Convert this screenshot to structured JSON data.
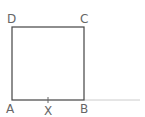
{
  "diagram": {
    "type": "geometry",
    "points": {
      "A": {
        "label": "A",
        "x": 12,
        "y": 100
      },
      "B": {
        "label": "B",
        "x": 84,
        "y": 100
      },
      "C": {
        "label": "C",
        "x": 84,
        "y": 27
      },
      "D": {
        "label": "D",
        "x": 12,
        "y": 27
      },
      "X": {
        "label": "X",
        "x": 48,
        "y": 100
      }
    },
    "extension": {
      "from": "B",
      "to_x": 140,
      "color": "#cccccc"
    },
    "colors": {
      "line": "#444444",
      "label": "#666666",
      "extension": "#cccccc"
    }
  }
}
